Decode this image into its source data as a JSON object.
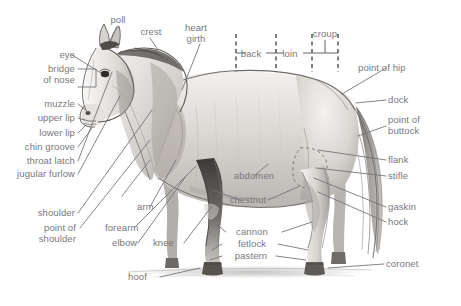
{
  "style": {
    "background": "#ffffff",
    "label_color": "#78787c",
    "leader_color": "#6f6f74",
    "dashed_color": "#2b2b2b",
    "coat_light": "#e9e7e4",
    "coat_mid": "#c9c6c2",
    "coat_dark": "#8d8a86",
    "ink": "#55524f"
  },
  "labels": {
    "poll": "poll",
    "crest": "crest",
    "heart_girth": "heart\ngirth",
    "heart_girth_l1": "heart",
    "heart_girth_l2": "girth",
    "back": "back",
    "loin": "loin",
    "croup": "croup",
    "point_of_hip": "point of hip",
    "dock": "dock",
    "point_of_buttock_l1": "point of",
    "point_of_buttock_l2": "buttock",
    "flank": "flank",
    "stifle": "stifle",
    "gaskin": "gaskin",
    "hock": "hock",
    "coronet": "coronet",
    "eye": "eye",
    "bridge_of_nose_l1": "bridge",
    "bridge_of_nose_l2": "of nose",
    "muzzle": "muzzle",
    "upper_lip": "upper lip",
    "lower_lip": "lower lip",
    "chin_groove": "chin groove",
    "throat_latch": "throat latch",
    "jugular_furlow": "jugular furlow",
    "shoulder": "shoulder",
    "point_of_shoulder_l1": "point of",
    "point_of_shoulder_l2": "shoulder",
    "arm": "arm",
    "forearm": "forearm",
    "elbow": "elbow",
    "knee": "knee",
    "hoof": "hoof",
    "abdomen": "abdomen",
    "chestnut": "chestnut",
    "cannon": "cannon",
    "fetlock": "fetlock",
    "pastern": "pastern"
  }
}
